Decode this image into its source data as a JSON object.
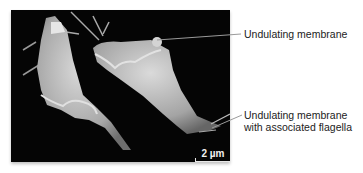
{
  "figure": {
    "scale_bar": {
      "label": "2 µm"
    },
    "labels": [
      {
        "id": "undulating-membrane",
        "text": "Undulating membrane"
      },
      {
        "id": "undulating-membrane-flagella",
        "lines": [
          "Undulating membrane",
          "with associated flagella"
        ]
      }
    ],
    "colors": {
      "background": "#050505",
      "cell": "#c8c8c8",
      "label_text": "#222222",
      "leader_line": "#9a9a9a"
    }
  }
}
